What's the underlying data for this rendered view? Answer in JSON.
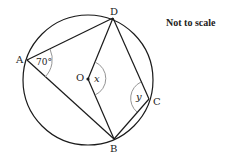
{
  "diagram": {
    "note": "Not to scale",
    "circle": {
      "cx": 88,
      "cy": 80,
      "r": 65,
      "center_label": "O"
    },
    "points": {
      "A": {
        "label": "A",
        "x": 27,
        "y": 60
      },
      "B": {
        "label": "B",
        "x": 114,
        "y": 139
      },
      "C": {
        "label": "C",
        "x": 149,
        "y": 99
      },
      "D": {
        "label": "D",
        "x": 113,
        "y": 18
      },
      "O": {
        "label": "O",
        "x": 88,
        "y": 79
      }
    },
    "segments": [
      "AD",
      "AB",
      "DB",
      "DC",
      "BC",
      "OD",
      "OB"
    ],
    "angles": {
      "A": {
        "label": "70°"
      },
      "O": {
        "label": "x"
      },
      "C": {
        "label": "y"
      }
    }
  },
  "colors": {
    "stroke": "#1a1a1a",
    "arc": "#888888",
    "text": "#222222"
  }
}
